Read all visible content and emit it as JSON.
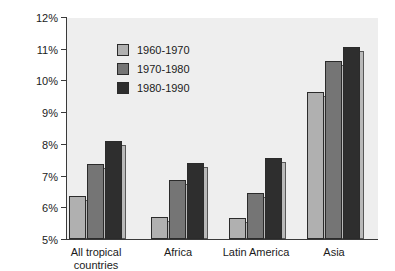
{
  "chart_data": {
    "type": "bar",
    "title": "",
    "xlabel": "",
    "ylabel": "",
    "ylim": [
      5,
      12
    ],
    "y_tick_labels": [
      "12%",
      "11%",
      "10%",
      "9%",
      "8%",
      "7%",
      "6%",
      "5%"
    ],
    "y_tick_values": [
      12,
      11,
      10,
      9,
      8,
      7,
      6,
      5
    ],
    "grid": false,
    "legend_position": "upper-left-inside",
    "categories": [
      "All tropical\ncountries",
      "Africa",
      "Latin America",
      "Asia"
    ],
    "series": [
      {
        "name": "1960-1970",
        "color": "#b0b0b0",
        "values": [
          6.35,
          5.7,
          5.65,
          9.65
        ]
      },
      {
        "name": "1970-1980",
        "color": "#757575",
        "values": [
          7.35,
          6.85,
          6.45,
          10.6
        ]
      },
      {
        "name": "1980-1990",
        "color": "#2e2e2e",
        "values": [
          8.1,
          7.4,
          7.55,
          11.05
        ]
      }
    ]
  },
  "legend": {
    "items": [
      {
        "label": "1960-1970"
      },
      {
        "label": "1970-1980"
      },
      {
        "label": "1980-1990"
      }
    ]
  },
  "axis": {
    "categories": [
      {
        "label": "All tropical\ncountries"
      },
      {
        "label": "Africa"
      },
      {
        "label": "Latin America"
      },
      {
        "label": "Asia"
      }
    ]
  }
}
